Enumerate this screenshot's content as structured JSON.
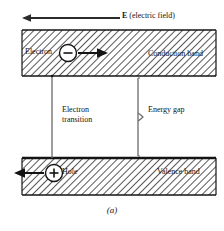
{
  "figure": {
    "caption": "(a)",
    "labels": {
      "efield_symbol": "E",
      "efield_text": " (electric field)",
      "electron": "Electron",
      "conduction_band": "Conduction band",
      "electron_transition": "Electron transition",
      "energy_gap": "Energy gap",
      "hole": "Hole",
      "valence_band": "Valence band"
    },
    "charges": {
      "electron_sign": "−",
      "hole_sign": "+"
    },
    "colors": {
      "ink": "#141414",
      "hatch": "#3a3a3a",
      "band_fill": "#ffffff",
      "background": "#ffffff"
    }
  }
}
